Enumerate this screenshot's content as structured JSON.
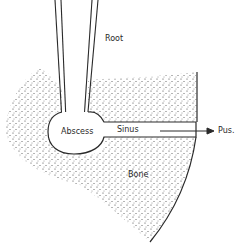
{
  "diagram": {
    "labels": {
      "root": "Root",
      "abscess": "Abscess",
      "sinus": "Sinus",
      "pus": "Pus.",
      "bone": "Bone"
    },
    "colors": {
      "line": "#2a2a2a",
      "stipple": "#3a3a3a",
      "background": "#ffffff"
    }
  }
}
